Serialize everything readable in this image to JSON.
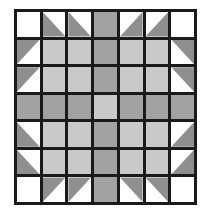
{
  "figure": {
    "kind": "quilt-block-diagram",
    "title": "",
    "background_color": "#ffffff",
    "grid_line_color": "#1a1a1a",
    "grid_line_width_px": 3,
    "border_width_px": 3,
    "rows": 7,
    "columns": 7
  },
  "palette": {
    "white": "#ffffff",
    "light_gray": "#c9c9c9",
    "medium_gray": "#a2a2a2",
    "triangle_gray": "#8f8f8f",
    "line": "#1a1a1a"
  },
  "legend": {
    "white_label": "white",
    "light_label": "light gray",
    "medium_label": "medium gray",
    "triangle_label": "half-square triangle"
  },
  "chart_data": {
    "type": "heatmap",
    "title": "",
    "xlabel": "",
    "ylabel": "",
    "grid": true,
    "legend_position": "none",
    "categories": [
      "c1",
      "c2",
      "c3",
      "c4",
      "c5",
      "c6",
      "c7"
    ],
    "row_labels": [
      "r1",
      "r2",
      "r3",
      "r4",
      "r5",
      "r6",
      "r7"
    ],
    "cell_kinds": [
      [
        "white",
        "tri-bl",
        "tri-bl",
        "med",
        "tri-br",
        "tri-br",
        "white"
      ],
      [
        "tri-tl",
        "light",
        "light",
        "med",
        "light",
        "light",
        "tri-tr"
      ],
      [
        "tri-tl",
        "light",
        "light",
        "med",
        "light",
        "light",
        "tri-tr"
      ],
      [
        "med",
        "med",
        "med",
        "light",
        "med",
        "med",
        "med"
      ],
      [
        "tri-bl",
        "light",
        "light",
        "med",
        "light",
        "light",
        "tri-br"
      ],
      [
        "tri-bl",
        "light",
        "light",
        "med",
        "light",
        "light",
        "tri-br"
      ],
      [
        "white",
        "tri-tl",
        "tri-tl",
        "med",
        "tri-tr",
        "tri-tr",
        "white"
      ]
    ],
    "values": [
      [
        0,
        1,
        1,
        2,
        1,
        1,
        0
      ],
      [
        1,
        3,
        3,
        2,
        3,
        3,
        1
      ],
      [
        1,
        3,
        3,
        2,
        3,
        3,
        1
      ],
      [
        2,
        2,
        2,
        3,
        2,
        2,
        2
      ],
      [
        1,
        3,
        3,
        2,
        3,
        3,
        1
      ],
      [
        1,
        3,
        3,
        2,
        3,
        3,
        1
      ],
      [
        0,
        1,
        1,
        2,
        1,
        1,
        0
      ]
    ],
    "value_key": {
      "0": "white",
      "1": "half-square triangle (medium gray on white)",
      "2": "medium gray",
      "3": "light gray"
    },
    "center_cell": {
      "row": 4,
      "column": 4,
      "kind": "light"
    },
    "symmetry": "4-fold (horizontal and vertical mirror)"
  }
}
